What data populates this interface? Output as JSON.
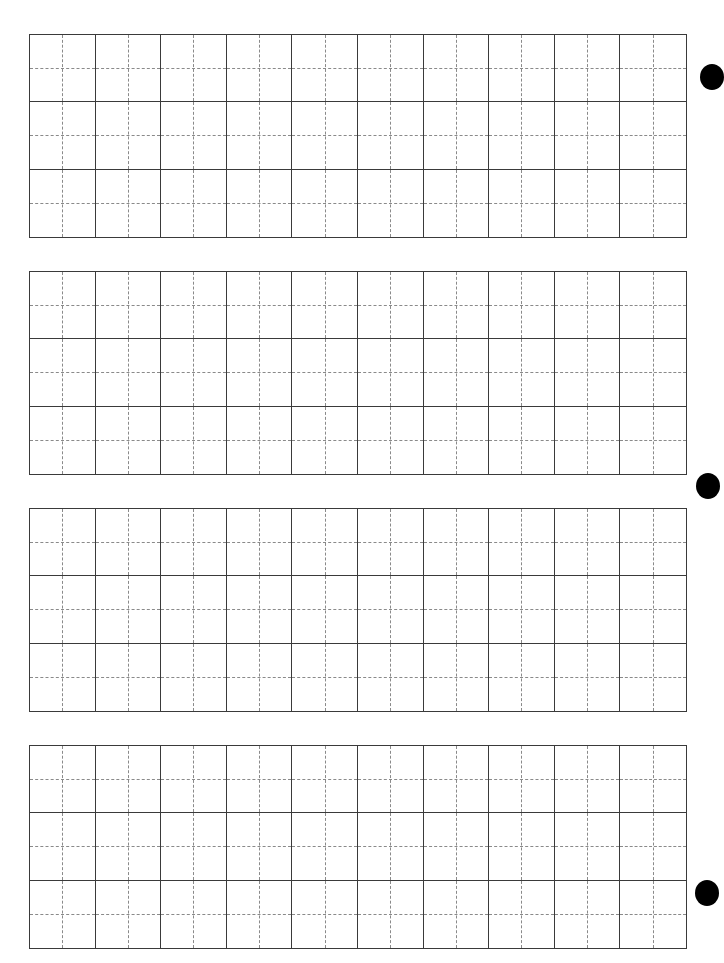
{
  "worksheet": {
    "type": "writing-practice-grid",
    "blocks": [
      {
        "id": 1,
        "top": 34,
        "rows": 3,
        "cols": 10
      },
      {
        "id": 2,
        "top": 271,
        "rows": 3,
        "cols": 10
      },
      {
        "id": 3,
        "top": 508,
        "rows": 3,
        "cols": 10
      },
      {
        "id": 4,
        "top": 745,
        "rows": 3,
        "cols": 10
      }
    ],
    "cell_guides": "dashed-center-cross",
    "colors": {
      "grid_line": "#3a3a3a",
      "guide_line": "#8a8a8a",
      "background": "#ffffff",
      "punch_hole": "#000000"
    }
  },
  "punch_holes": [
    {
      "cx": 712,
      "cy": 77
    },
    {
      "cx": 708,
      "cy": 486
    },
    {
      "cx": 707,
      "cy": 893
    }
  ]
}
